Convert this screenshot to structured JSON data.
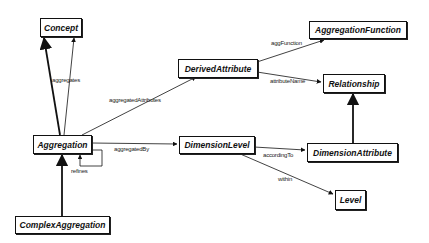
{
  "diagram": {
    "type": "UML class diagram",
    "classes": [
      {
        "id": "concept",
        "name": "Concept"
      },
      {
        "id": "aggregation_function",
        "name": "AggregationFunction"
      },
      {
        "id": "derived_attribute",
        "name": "DerivedAttribute"
      },
      {
        "id": "relationship",
        "name": "Relationship"
      },
      {
        "id": "aggregation",
        "name": "Aggregation"
      },
      {
        "id": "dimension_level",
        "name": "DimensionLevel"
      },
      {
        "id": "dimension_attribute",
        "name": "DimensionAttribute"
      },
      {
        "id": "level",
        "name": "Level"
      },
      {
        "id": "complex_aggregation",
        "name": "ComplexAggregation"
      }
    ],
    "associations": [
      {
        "from": "Aggregation",
        "to": "Concept",
        "label": "aggregates"
      },
      {
        "from": "Aggregation",
        "to": "DerivedAttribute",
        "label": "aggregatedAttributes"
      },
      {
        "from": "DerivedAttribute",
        "to": "AggregationFunction",
        "label": "aggFunction"
      },
      {
        "from": "DerivedAttribute",
        "to": "Relationship",
        "label": "attributeName"
      },
      {
        "from": "Aggregation",
        "to": "DimensionLevel",
        "label": "aggregatedBy"
      },
      {
        "from": "Aggregation",
        "to": "Aggregation",
        "label": "refines"
      },
      {
        "from": "DimensionLevel",
        "to": "DimensionAttribute",
        "label": "accordingTo"
      },
      {
        "from": "DimensionLevel",
        "to": "Level",
        "label": "within"
      }
    ],
    "generalizations": [
      {
        "child": "Aggregation",
        "parent": "Concept"
      },
      {
        "child": "ComplexAggregation",
        "parent": "Aggregation"
      },
      {
        "child": "DimensionAttribute",
        "parent": "Relationship"
      }
    ]
  }
}
